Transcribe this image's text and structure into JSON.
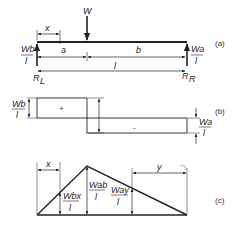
{
  "diagram": {
    "colors": {
      "line": "#222222",
      "background": "#ffffff"
    },
    "panel_a": {
      "tag": "(a)",
      "load": "W",
      "dim_x": "x",
      "dim_a": "a",
      "dim_b": "b",
      "dim_l": "l",
      "left_reaction_num": "Wb",
      "left_reaction_den": "l",
      "right_reaction_num": "Wa",
      "right_reaction_den": "l",
      "left_support": "R",
      "left_support_sub": "L",
      "right_support": "R",
      "right_support_sub": "R"
    },
    "panel_b": {
      "tag": "(b)",
      "positive_sign": "+",
      "negative_sign": "-",
      "left_value_num": "Wb",
      "left_value_den": "l",
      "right_value_num": "Wa",
      "right_value_den": "l"
    },
    "panel_c": {
      "tag": "(c)",
      "dim_x": "x",
      "dim_y": "y",
      "m_x_num": "Wbx",
      "m_x_den": "l",
      "m_max_num": "Wab",
      "m_max_den": "l",
      "m_y_num": "Way",
      "m_y_den": "l"
    }
  }
}
